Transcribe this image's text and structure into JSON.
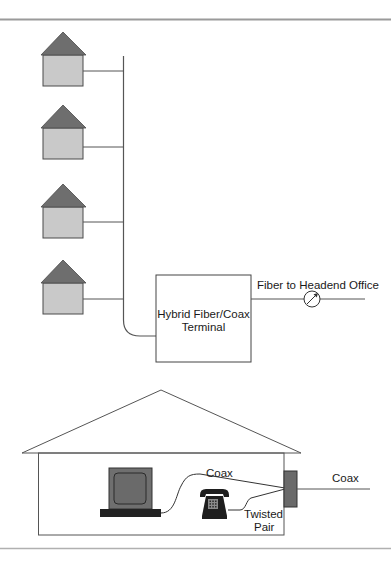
{
  "colors": {
    "rule": "#9a9a9a",
    "line": "#555555",
    "roof": "#6e6e6e",
    "house_body": "#c9c9c9",
    "house_outline": "#4a4a4a",
    "monitor": "#6f6f6f",
    "keyboard": "#222222",
    "phone": "#1e1e1e",
    "jack": "#6a6a6a",
    "text": "#1a1a1a"
  },
  "houses": [
    {
      "id": "house-1",
      "connector_y": 71
    },
    {
      "id": "house-2",
      "connector_y": 147
    },
    {
      "id": "house-3",
      "connector_y": 222
    },
    {
      "id": "house-4",
      "connector_y": 299
    }
  ],
  "terminal": {
    "line1": "Hybrid Fiber/Coax",
    "line2": "Terminal"
  },
  "fiber": {
    "label": "Fiber to Headend Office",
    "icon": "optical-fiber-node-icon"
  },
  "home": {
    "coax_inside_label": "Coax",
    "coax_outside_label": "Coax",
    "twisted_pair_line1": "Twisted",
    "twisted_pair_line2": "Pair",
    "devices": [
      "computer-icon",
      "telephone-icon",
      "wall-jack-icon"
    ]
  }
}
